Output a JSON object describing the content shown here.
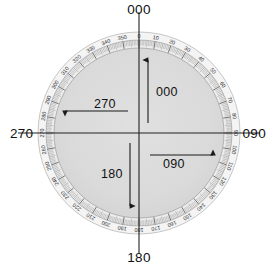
{
  "diagram": {
    "center": {
      "x": 139,
      "y": 133
    },
    "outer_radius": 101,
    "colors": {
      "face": "#d9d9d9",
      "ring": "#f2f2f2",
      "tick": "#8c8c8c",
      "line": "#222222",
      "edge": "#9a9a9a",
      "text": "#111111"
    },
    "ring_scale": {
      "step_degrees": 10,
      "minor_step_degrees": 1,
      "labels": [
        "0",
        "10",
        "20",
        "30",
        "40",
        "50",
        "60",
        "70",
        "80",
        "90",
        "100",
        "110",
        "120",
        "130",
        "140",
        "150",
        "160",
        "170",
        "180",
        "190",
        "200",
        "210",
        "220",
        "230",
        "240",
        "250",
        "260",
        "270",
        "280",
        "290",
        "300",
        "310",
        "320",
        "330",
        "340",
        "350"
      ]
    },
    "axis_labels": [
      {
        "name": "top",
        "text": "000",
        "angle": 0
      },
      {
        "name": "right",
        "text": "090",
        "angle": 90
      },
      {
        "name": "bottom",
        "text": "180",
        "angle": 180
      },
      {
        "name": "left",
        "text": "270",
        "angle": 270
      }
    ],
    "inner_arrows": [
      {
        "name": "north",
        "text": "000",
        "direction": "up"
      },
      {
        "name": "east",
        "text": "090",
        "direction": "right"
      },
      {
        "name": "south",
        "text": "180",
        "direction": "down"
      },
      {
        "name": "west",
        "text": "270",
        "direction": "left"
      }
    ]
  },
  "chart_data": {
    "type": "polar-scale",
    "axis_min": 0,
    "axis_max": 360,
    "major_tick_step": 10,
    "minor_tick_step": 1,
    "tick_labels": [
      "0",
      "10",
      "20",
      "30",
      "40",
      "50",
      "60",
      "70",
      "80",
      "90",
      "100",
      "110",
      "120",
      "130",
      "140",
      "150",
      "160",
      "170",
      "180",
      "190",
      "200",
      "210",
      "220",
      "230",
      "240",
      "250",
      "260",
      "270",
      "280",
      "290",
      "300",
      "310",
      "320",
      "330",
      "340",
      "350"
    ],
    "annotations": [
      {
        "label": "000",
        "position": "outer-top",
        "value": 0
      },
      {
        "label": "090",
        "position": "outer-right",
        "value": 90
      },
      {
        "label": "180",
        "position": "outer-bottom",
        "value": 180
      },
      {
        "label": "270",
        "position": "outer-left",
        "value": 270
      },
      {
        "label": "000",
        "position": "inner-arrow-up",
        "value": 0
      },
      {
        "label": "090",
        "position": "inner-arrow-right",
        "value": 90
      },
      {
        "label": "180",
        "position": "inner-arrow-down",
        "value": 180
      },
      {
        "label": "270",
        "position": "inner-arrow-left",
        "value": 270
      }
    ],
    "legend": [],
    "grid": false
  }
}
